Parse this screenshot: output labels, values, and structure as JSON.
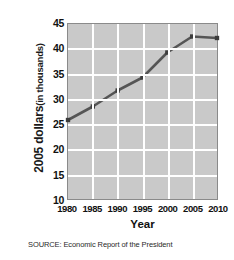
{
  "figure": {
    "source_note": "SOURCE: Economic Report of the President"
  },
  "chart_data": {
    "type": "line",
    "title": "",
    "xlabel": "Year",
    "ylabel": "2005 dollars (in thousands)",
    "ylabel_parts": {
      "strong": "2005 dollars",
      "light": "(in thousands)"
    },
    "x": [
      1980,
      1985,
      1990,
      1995,
      2000,
      2005,
      2010
    ],
    "values": [
      25.8,
      28.5,
      31.7,
      34.3,
      39.3,
      42.5,
      42.2
    ],
    "xticklabels": [
      "1980",
      "1985",
      "1990",
      "1995",
      "2000",
      "2005",
      "2010"
    ],
    "yticklabels": [
      "10",
      "15",
      "20",
      "25",
      "30",
      "35",
      "40",
      "45"
    ],
    "yticks": [
      10,
      15,
      20,
      25,
      30,
      35,
      40,
      45
    ],
    "xlim": [
      1980,
      2010
    ],
    "ylim": [
      10,
      45
    ],
    "grid": true,
    "legend": "none",
    "marker": "square",
    "colors": {
      "line": "#555555",
      "marker": "#3c3c3c",
      "plot_background": "#c9c9c9",
      "gridline": "#ffffff",
      "frame": "#8a8a8a",
      "page_background": "#ffffff",
      "text": "#111111"
    }
  }
}
